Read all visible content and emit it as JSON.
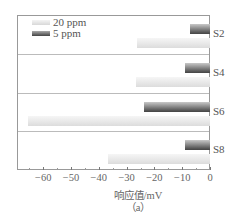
{
  "chart_data": {
    "type": "bar",
    "orientation": "horizontal",
    "title": "",
    "categories": [
      "S2",
      "S4",
      "S6",
      "S8"
    ],
    "series": [
      {
        "name": "20 ppm",
        "values": [
          -26.5,
          -27,
          -66,
          -37
        ],
        "color": "#e0e0e0"
      },
      {
        "name": "5 ppm",
        "values": [
          -7.5,
          -9.5,
          -24,
          -9.5
        ],
        "color": "#555555"
      }
    ],
    "xlabel": "响应值/mV",
    "ylabel": "",
    "xlim": [
      -70,
      0
    ],
    "xticks": [
      -60,
      -50,
      -40,
      -30,
      -20,
      -10,
      0
    ],
    "xtick_labels": [
      "−60",
      "−50",
      "−40",
      "−30",
      "−20",
      "−10",
      "0"
    ],
    "legend_position": "upper left",
    "grid": false,
    "caption": "（a）"
  },
  "legend": [
    {
      "label": "20 ppm"
    },
    {
      "label": "5 ppm"
    }
  ],
  "axis": {
    "xlabel": "响应值/mV",
    "caption": "（a）"
  }
}
